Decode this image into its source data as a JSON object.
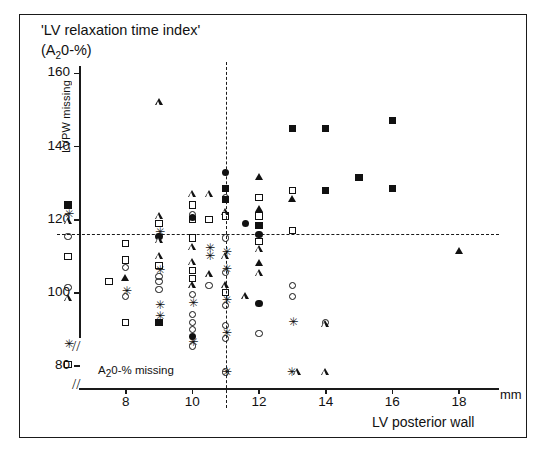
{
  "figure": {
    "title_line1": "'LV relaxation time index'",
    "title_line2_pre": "(A",
    "title_line2_sub": "2",
    "title_line2_post": "0-%)",
    "x_axis_title": "LV posterior wall",
    "x_unit": "mm",
    "note_lvpw_missing": "LVPW missing",
    "note_a2o_missing_pre": "A",
    "note_a2o_missing_sub": "2",
    "note_a2o_missing_post": "0-% missing",
    "axis_break_glyph": "//"
  },
  "chart_data": {
    "type": "scatter",
    "title": "'LV relaxation time index' (A20-%)",
    "xlabel": "LV posterior wall (mm)",
    "ylabel": "'LV relaxation time index' (A20-%)",
    "xlim": [
      6.6,
      19.2
    ],
    "ylim": [
      74,
      162
    ],
    "xticks": [
      8,
      10,
      12,
      14,
      16,
      18
    ],
    "yticks": [
      80,
      100,
      120,
      140,
      160
    ],
    "grid": false,
    "axis_breaks": {
      "x": true,
      "y": true
    },
    "reference_lines": [
      {
        "name": "horizontal-reference",
        "orientation": "horizontal",
        "value": 116,
        "style": "dashed"
      },
      {
        "name": "vertical-reference",
        "orientation": "vertical",
        "value": 11,
        "style": "dashed"
      }
    ],
    "legend": {
      "position": "none",
      "entries": []
    },
    "marker_types": [
      "open-square",
      "filled-square",
      "open-circle",
      "filled-circle",
      "open-triangle",
      "filled-triangle",
      "star"
    ],
    "side_column_lvpw_missing": {
      "label": "LVPW missing",
      "x_pixel_column": true,
      "points": [
        {
          "y": 124,
          "marker": "filled-square"
        },
        {
          "y": 121.5,
          "marker": "star"
        },
        {
          "y": 119.5,
          "marker": "open-triangle"
        },
        {
          "y": 115.5,
          "marker": "open-circle"
        },
        {
          "y": 110,
          "marker": "open-square"
        },
        {
          "y": 101.5,
          "marker": "open-circle"
        },
        {
          "y": 98.5,
          "marker": "open-triangle"
        },
        {
          "y": 86,
          "marker": "star"
        },
        {
          "y": 80.5,
          "marker": "open-square"
        }
      ]
    },
    "bottom_row_a2o_missing": {
      "label": "A20-% missing",
      "points": [
        {
          "x": 11,
          "marker": "star"
        },
        {
          "x": 11,
          "marker": "open-circle"
        },
        {
          "x": 12.95,
          "marker": "star"
        },
        {
          "x": 13.15,
          "marker": "open-triangle"
        },
        {
          "x": 14,
          "marker": "open-triangle"
        }
      ]
    },
    "points": [
      {
        "x": 7.5,
        "y": 103,
        "marker": "open-square"
      },
      {
        "x": 8,
        "y": 113.5,
        "marker": "open-square"
      },
      {
        "x": 8,
        "y": 109,
        "marker": "open-square"
      },
      {
        "x": 8,
        "y": 107,
        "marker": "open-circle"
      },
      {
        "x": 8,
        "y": 104,
        "marker": "filled-triangle"
      },
      {
        "x": 8,
        "y": 100.5,
        "marker": "star"
      },
      {
        "x": 8,
        "y": 99,
        "marker": "open-circle"
      },
      {
        "x": 8,
        "y": 92,
        "marker": "open-square"
      },
      {
        "x": 9,
        "y": 152,
        "marker": "open-triangle"
      },
      {
        "x": 9,
        "y": 121,
        "marker": "open-triangle"
      },
      {
        "x": 9,
        "y": 119,
        "marker": "open-square"
      },
      {
        "x": 9,
        "y": 116.5,
        "marker": "star"
      },
      {
        "x": 9,
        "y": 115.5,
        "marker": "filled-circle"
      },
      {
        "x": 9,
        "y": 114.5,
        "marker": "open-triangle"
      },
      {
        "x": 9,
        "y": 110,
        "marker": "open-triangle"
      },
      {
        "x": 9,
        "y": 107.5,
        "marker": "open-square"
      },
      {
        "x": 9,
        "y": 106,
        "marker": "star"
      },
      {
        "x": 9,
        "y": 104.5,
        "marker": "open-circle"
      },
      {
        "x": 9,
        "y": 103,
        "marker": "open-circle"
      },
      {
        "x": 9,
        "y": 101,
        "marker": "open-circle"
      },
      {
        "x": 9,
        "y": 96.5,
        "marker": "star"
      },
      {
        "x": 9,
        "y": 93.5,
        "marker": "star"
      },
      {
        "x": 9,
        "y": 92,
        "marker": "filled-square"
      },
      {
        "x": 10,
        "y": 127,
        "marker": "open-triangle"
      },
      {
        "x": 10,
        "y": 124,
        "marker": "open-square"
      },
      {
        "x": 10,
        "y": 121.5,
        "marker": "open-circle"
      },
      {
        "x": 10,
        "y": 120.5,
        "marker": "filled-circle"
      },
      {
        "x": 10,
        "y": 120,
        "marker": "open-square"
      },
      {
        "x": 10,
        "y": 115,
        "marker": "open-square"
      },
      {
        "x": 10,
        "y": 112.5,
        "marker": "open-triangle"
      },
      {
        "x": 10,
        "y": 108.5,
        "marker": "open-triangle"
      },
      {
        "x": 10,
        "y": 106,
        "marker": "open-square"
      },
      {
        "x": 10,
        "y": 104,
        "marker": "open-square"
      },
      {
        "x": 10,
        "y": 102,
        "marker": "open-triangle"
      },
      {
        "x": 10,
        "y": 99.5,
        "marker": "open-circle"
      },
      {
        "x": 10,
        "y": 97,
        "marker": "star"
      },
      {
        "x": 10,
        "y": 94,
        "marker": "open-circle"
      },
      {
        "x": 10,
        "y": 92,
        "marker": "open-circle"
      },
      {
        "x": 10,
        "y": 90,
        "marker": "open-circle"
      },
      {
        "x": 10,
        "y": 88,
        "marker": "filled-circle"
      },
      {
        "x": 10,
        "y": 86.5,
        "marker": "star"
      },
      {
        "x": 10,
        "y": 85.5,
        "marker": "open-circle"
      },
      {
        "x": 10.5,
        "y": 127,
        "marker": "open-triangle"
      },
      {
        "x": 10.5,
        "y": 120,
        "marker": "open-square"
      },
      {
        "x": 10.5,
        "y": 112,
        "marker": "star"
      },
      {
        "x": 10.5,
        "y": 110,
        "marker": "star"
      },
      {
        "x": 10.5,
        "y": 105,
        "marker": "open-triangle"
      },
      {
        "x": 10.5,
        "y": 102,
        "marker": "open-circle"
      },
      {
        "x": 11,
        "y": 133,
        "marker": "filled-circle"
      },
      {
        "x": 11,
        "y": 128.5,
        "marker": "filled-square"
      },
      {
        "x": 11,
        "y": 126,
        "marker": "open-circle"
      },
      {
        "x": 11,
        "y": 125.5,
        "marker": "filled-square"
      },
      {
        "x": 11,
        "y": 122,
        "marker": "open-triangle"
      },
      {
        "x": 11,
        "y": 121,
        "marker": "open-square"
      },
      {
        "x": 11,
        "y": 115,
        "marker": "open-circle"
      },
      {
        "x": 11,
        "y": 111,
        "marker": "star"
      },
      {
        "x": 11,
        "y": 110,
        "marker": "open-triangle"
      },
      {
        "x": 11,
        "y": 106.5,
        "marker": "star"
      },
      {
        "x": 11,
        "y": 105.5,
        "marker": "open-circle"
      },
      {
        "x": 11,
        "y": 102,
        "marker": "open-triangle"
      },
      {
        "x": 11,
        "y": 100,
        "marker": "open-square"
      },
      {
        "x": 11,
        "y": 98,
        "marker": "star"
      },
      {
        "x": 11,
        "y": 96.5,
        "marker": "open-circle"
      },
      {
        "x": 11,
        "y": 91,
        "marker": "open-circle"
      },
      {
        "x": 11,
        "y": 89,
        "marker": "star"
      },
      {
        "x": 11,
        "y": 87.5,
        "marker": "open-circle"
      },
      {
        "x": 11.6,
        "y": 119,
        "marker": "filled-circle"
      },
      {
        "x": 11.6,
        "y": 99,
        "marker": "open-triangle"
      },
      {
        "x": 12,
        "y": 131.5,
        "marker": "filled-triangle"
      },
      {
        "x": 12,
        "y": 126,
        "marker": "open-square"
      },
      {
        "x": 12,
        "y": 123,
        "marker": "filled-triangle"
      },
      {
        "x": 12,
        "y": 121,
        "marker": "open-square"
      },
      {
        "x": 12,
        "y": 118.5,
        "marker": "filled-square"
      },
      {
        "x": 12,
        "y": 116,
        "marker": "filled-circle"
      },
      {
        "x": 12,
        "y": 114,
        "marker": "open-square"
      },
      {
        "x": 12,
        "y": 112,
        "marker": "open-triangle"
      },
      {
        "x": 12,
        "y": 108,
        "marker": "filled-triangle"
      },
      {
        "x": 12,
        "y": 105.5,
        "marker": "open-triangle"
      },
      {
        "x": 12,
        "y": 97,
        "marker": "filled-circle"
      },
      {
        "x": 12,
        "y": 89,
        "marker": "open-circle"
      },
      {
        "x": 13,
        "y": 145,
        "marker": "filled-square"
      },
      {
        "x": 13,
        "y": 128,
        "marker": "open-square"
      },
      {
        "x": 13,
        "y": 125.5,
        "marker": "filled-triangle"
      },
      {
        "x": 13,
        "y": 117,
        "marker": "open-square"
      },
      {
        "x": 13,
        "y": 102,
        "marker": "open-circle"
      },
      {
        "x": 13,
        "y": 99,
        "marker": "open-circle"
      },
      {
        "x": 13,
        "y": 92,
        "marker": "star"
      },
      {
        "x": 14,
        "y": 145,
        "marker": "filled-square"
      },
      {
        "x": 14,
        "y": 128,
        "marker": "filled-square"
      },
      {
        "x": 14,
        "y": 92,
        "marker": "open-circle"
      },
      {
        "x": 14,
        "y": 91.5,
        "marker": "open-triangle"
      },
      {
        "x": 15,
        "y": 131.5,
        "marker": "filled-square"
      },
      {
        "x": 16,
        "y": 147,
        "marker": "filled-square"
      },
      {
        "x": 16,
        "y": 128.5,
        "marker": "filled-square"
      },
      {
        "x": 18,
        "y": 111.5,
        "marker": "filled-triangle"
      }
    ]
  },
  "axes": {
    "y_tick_labels": [
      "160",
      "140",
      "120",
      "100",
      "80"
    ],
    "x_tick_labels": [
      "8",
      "10",
      "12",
      "14",
      "16",
      "18"
    ]
  }
}
